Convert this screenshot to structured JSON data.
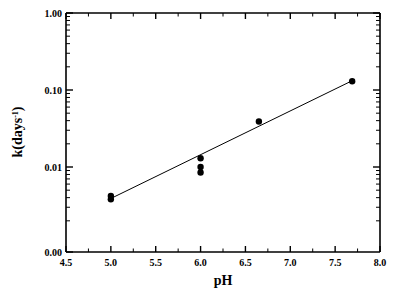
{
  "chart_data": {
    "type": "scatter",
    "title": "",
    "xlabel": "pH",
    "ylabel": "k(days-1)",
    "ylabel_base": "k(days",
    "ylabel_sup": "-1",
    "ylabel_close": ")",
    "xlim": [
      4.5,
      8.0
    ],
    "ylim": [
      0.001,
      1.0
    ],
    "yscale": "log",
    "xscale": "linear",
    "grid": false,
    "legend": null,
    "xticks": [
      4.5,
      5.0,
      5.5,
      6.0,
      6.5,
      7.0,
      7.5,
      8.0
    ],
    "xticklabels": [
      "4.5",
      "5.0",
      "5.5",
      "6.0",
      "6.5",
      "7.0",
      "7.5",
      "8.0"
    ],
    "yticks": [
      1.0,
      0.1,
      0.01,
      0.001
    ],
    "yticklabels": [
      "1.00",
      "0.10",
      "0.01",
      "0.00"
    ],
    "x": [
      5.0,
      5.0,
      6.0,
      6.0,
      6.0,
      6.65,
      7.69
    ],
    "y": [
      0.0038,
      0.0042,
      0.0085,
      0.01,
      0.013,
      0.039,
      0.13
    ],
    "points": [
      {
        "ph": 5.0,
        "k": 0.0038
      },
      {
        "ph": 5.0,
        "k": 0.0042
      },
      {
        "ph": 6.0,
        "k": 0.0085
      },
      {
        "ph": 6.0,
        "k": 0.01
      },
      {
        "ph": 6.0,
        "k": 0.013
      },
      {
        "ph": 6.65,
        "k": 0.039
      },
      {
        "ph": 7.69,
        "k": 0.13
      }
    ],
    "series": [
      {
        "name": "hydrolysis rate constant",
        "marker": "filled-circle",
        "marker_color": "#000000",
        "values": [
          0.0038,
          0.0042,
          0.0085,
          0.01,
          0.013,
          0.039,
          0.13
        ]
      },
      {
        "name": "linear regression fit",
        "type": "line",
        "line_color": "#000000",
        "endpoints": [
          {
            "ph": 5.0,
            "k": 0.0039
          },
          {
            "ph": 7.69,
            "k": 0.132
          }
        ]
      }
    ],
    "frame_color": "#000000",
    "background_color": "#ffffff"
  },
  "figure": {
    "marker_radius": 3.2,
    "point_labels": [
      "pH 5.0 replicate 1",
      "pH 5.0 replicate 2",
      "pH 6.0 replicate 1",
      "pH 6.0 replicate 2",
      "pH 6.0 replicate 3",
      "pH 6.65",
      "pH 7.69"
    ]
  }
}
